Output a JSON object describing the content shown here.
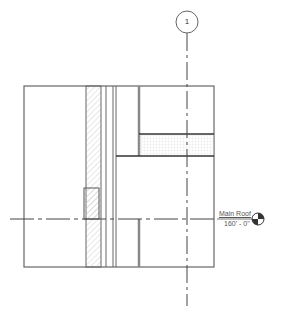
{
  "view": {
    "type": "section-drawing",
    "background": "#ffffff",
    "line_color": "#555555"
  },
  "grid": {
    "label": "1",
    "bubble_center": [
      187,
      22
    ],
    "bubble_radius": 11,
    "line_x": 187,
    "line_y_range": [
      33,
      306
    ]
  },
  "level": {
    "name": "Main Roof",
    "elevation": "160' - 0\"",
    "line_y": 219,
    "line_x_range": [
      10,
      214
    ],
    "symbol": "level-target-icon"
  },
  "outline": {
    "x": 24,
    "y": 86,
    "w": 190,
    "h": 181
  }
}
